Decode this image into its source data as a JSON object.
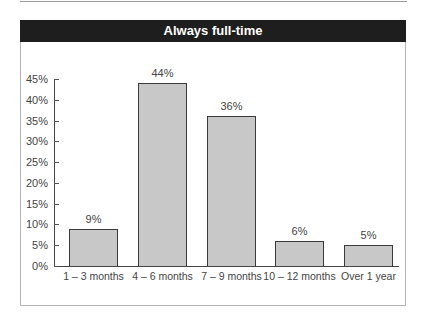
{
  "chart_data": {
    "type": "bar",
    "title": "Always full-time",
    "categories": [
      "1 – 3 months",
      "4 – 6 months",
      "7 – 9 months",
      "10 – 12 months",
      "Over 1 year"
    ],
    "values": [
      9,
      44,
      36,
      6,
      5
    ],
    "value_labels": [
      "9%",
      "44%",
      "36%",
      "6%",
      "5%"
    ],
    "xlabel": "",
    "ylabel": "",
    "ylim": [
      0,
      45
    ],
    "yticks": [
      "0%",
      "5%",
      "10%",
      "15%",
      "20%",
      "25%",
      "30%",
      "35%",
      "40%",
      "45%"
    ],
    "grid": false,
    "legend": null,
    "colors": {
      "bar_fill": "#c8c8c8",
      "bar_edge": "#3a3a3a",
      "title_bg": "#1e1e1e",
      "title_text": "#ffffff"
    }
  }
}
